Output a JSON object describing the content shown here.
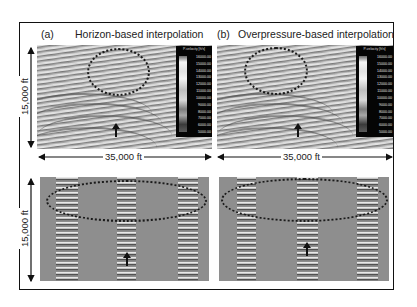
{
  "figure": {
    "panels": [
      {
        "id": "a",
        "label": "(a)",
        "title": "Horizon-based interpolation"
      },
      {
        "id": "b",
        "label": "(b)",
        "title": "Overpressure-based interpolation"
      }
    ],
    "dimensions": {
      "width_label": "35,000 ft",
      "height_label": "15,000 ft"
    },
    "colorbar": {
      "title": "P-velocity [ft/s]",
      "ticks": [
        "16000.00",
        "15000.00",
        "14000.00",
        "13000.00",
        "12000.00",
        "11000.00",
        "10000.00",
        "9000.00",
        "8000.00",
        "7000.00",
        "6000.00",
        "5000.00"
      ]
    },
    "annotations": {
      "ellipse_style": "dotted",
      "arrow_direction": "up"
    }
  }
}
